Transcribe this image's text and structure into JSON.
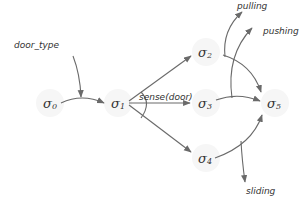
{
  "diagram": {
    "nodes": [
      {
        "id": "s0",
        "symbol": "σ",
        "sub": "0",
        "x": 50,
        "y": 103
      },
      {
        "id": "s1",
        "symbol": "σ",
        "sub": "1",
        "x": 118,
        "y": 103
      },
      {
        "id": "s2",
        "symbol": "σ",
        "sub": "2",
        "x": 206,
        "y": 52
      },
      {
        "id": "s3",
        "symbol": "σ",
        "sub": "3",
        "x": 206,
        "y": 103
      },
      {
        "id": "s4",
        "symbol": "σ",
        "sub": "4",
        "x": 206,
        "y": 158
      },
      {
        "id": "s5",
        "symbol": "σ",
        "sub": "5",
        "x": 275,
        "y": 103
      }
    ],
    "labels": {
      "door_type": "door_type",
      "sense": "sense(door)",
      "pulling": "pulling",
      "pushing": "pushing",
      "sliding": "sliding"
    },
    "edges": [
      {
        "from": "door_type",
        "to": "s0-s1 edge",
        "kind": "input"
      },
      {
        "from": "s0",
        "to": "s1"
      },
      {
        "from": "s1",
        "to": "s2",
        "label_ref": "sense"
      },
      {
        "from": "s1",
        "to": "s3",
        "label_ref": "sense"
      },
      {
        "from": "s1",
        "to": "s4",
        "label_ref": "sense"
      },
      {
        "from": "s2",
        "to": "s5",
        "output": "pulling"
      },
      {
        "from": "s3",
        "to": "s5",
        "output": "pushing"
      },
      {
        "from": "s4",
        "to": "s5",
        "output": "sliding"
      }
    ],
    "colors": {
      "edge": "#6a6a6a",
      "text": "#333333",
      "background": "#ffffff"
    }
  }
}
